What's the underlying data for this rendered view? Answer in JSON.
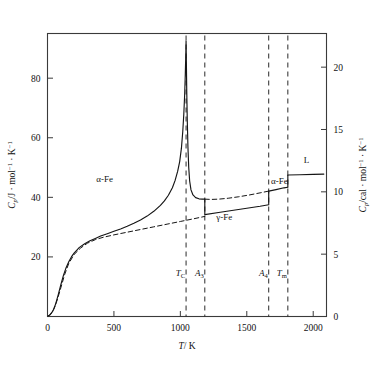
{
  "chart_data": {
    "type": "line",
    "title": "",
    "xlabel": "T/K",
    "ylabel": "Cp/J·mol-1·K-1",
    "ylabel_right": "Cp/cal·mol-1·K-1",
    "xlim": [
      0,
      2100
    ],
    "ylim": [
      0,
      95
    ],
    "ylim_right": [
      0,
      22.7
    ],
    "grid": false,
    "legend": null,
    "x_ticks": [
      0,
      500,
      1000,
      1500,
      2000
    ],
    "x_tick_labels": [
      "0",
      "500",
      "1000",
      "1500",
      "2000"
    ],
    "y_ticks": [
      20,
      40,
      60,
      80
    ],
    "y_tick_labels": [
      "20",
      "40",
      "60",
      "80"
    ],
    "y_ticks_right": [
      0,
      5,
      10,
      15,
      20
    ],
    "y_tick_labels_right": [
      "0",
      "5",
      "10",
      "15",
      "20"
    ],
    "transitions": [
      {
        "name": "T_C",
        "label_main": "T",
        "label_sub": "C",
        "x": 1043
      },
      {
        "name": "A_3",
        "label_main": "A",
        "label_sub": "3",
        "x": 1184
      },
      {
        "name": "A_4",
        "label_main": "A",
        "label_sub": "4",
        "x": 1665
      },
      {
        "name": "T_m",
        "label_main": "T",
        "label_sub": "m",
        "x": 1809
      }
    ],
    "region_labels": [
      {
        "name": "alpha-Fe-low",
        "text": "α-Fe",
        "x": 430,
        "y": 46
      },
      {
        "name": "gamma-Fe",
        "text": "γ-Fe",
        "x": 1330,
        "y": 33.5
      },
      {
        "name": "alpha-Fe-high",
        "text": "α-Fe",
        "x": 1745,
        "y": 45.5
      },
      {
        "name": "liquid",
        "text": "L",
        "x": 1950,
        "y": 52.5
      }
    ],
    "series": [
      {
        "name": "Cp-measured",
        "style": "solid",
        "points": [
          [
            5,
            0.2
          ],
          [
            20,
            0.6
          ],
          [
            40,
            1.8
          ],
          [
            60,
            4.0
          ],
          [
            80,
            7.2
          ],
          [
            100,
            10.6
          ],
          [
            120,
            13.8
          ],
          [
            140,
            16.4
          ],
          [
            160,
            18.4
          ],
          [
            180,
            20.0
          ],
          [
            200,
            21.3
          ],
          [
            240,
            23.2
          ],
          [
            280,
            24.4
          ],
          [
            320,
            25.4
          ],
          [
            360,
            26.2
          ],
          [
            400,
            27.0
          ],
          [
            450,
            27.8
          ],
          [
            500,
            28.6
          ],
          [
            550,
            29.4
          ],
          [
            600,
            30.3
          ],
          [
            650,
            31.3
          ],
          [
            700,
            32.4
          ],
          [
            750,
            33.7
          ],
          [
            800,
            35.3
          ],
          [
            850,
            37.3
          ],
          [
            880,
            38.8
          ],
          [
            910,
            40.7
          ],
          [
            940,
            43.2
          ],
          [
            960,
            45.6
          ],
          [
            980,
            48.8
          ],
          [
            995,
            52.0
          ],
          [
            1008,
            56.5
          ],
          [
            1018,
            62.0
          ],
          [
            1026,
            68.0
          ],
          [
            1032,
            74.0
          ],
          [
            1037,
            81.0
          ],
          [
            1041,
            88.0
          ],
          [
            1043,
            92.5
          ],
          [
            1045,
            86.0
          ],
          [
            1048,
            76.0
          ],
          [
            1052,
            66.0
          ],
          [
            1057,
            57.0
          ],
          [
            1063,
            50.0
          ],
          [
            1070,
            45.5
          ],
          [
            1080,
            42.5
          ],
          [
            1095,
            40.8
          ],
          [
            1115,
            39.9
          ],
          [
            1140,
            39.5
          ],
          [
            1165,
            39.4
          ],
          [
            1184,
            39.4
          ]
        ]
      },
      {
        "name": "Cp-gamma-austenite",
        "style": "solid",
        "points": [
          [
            1184,
            34.2
          ],
          [
            1300,
            35.0
          ],
          [
            1450,
            36.0
          ],
          [
            1600,
            37.0
          ],
          [
            1665,
            37.5
          ]
        ]
      },
      {
        "name": "Cp-delta-ferrite",
        "style": "solid",
        "points": [
          [
            1665,
            42.1
          ],
          [
            1720,
            42.6
          ],
          [
            1780,
            43.2
          ],
          [
            1809,
            43.4
          ]
        ]
      },
      {
        "name": "Cp-liquid",
        "style": "solid",
        "points": [
          [
            1809,
            47.5
          ],
          [
            1900,
            47.6
          ],
          [
            2000,
            47.7
          ],
          [
            2080,
            47.8
          ]
        ]
      },
      {
        "name": "Cp-lattice-baseline",
        "style": "dashed",
        "points": [
          [
            5,
            0.2
          ],
          [
            25,
            0.8
          ],
          [
            50,
            2.6
          ],
          [
            75,
            5.8
          ],
          [
            100,
            9.6
          ],
          [
            130,
            14.2
          ],
          [
            160,
            17.8
          ],
          [
            200,
            20.8
          ],
          [
            250,
            23.0
          ],
          [
            300,
            24.6
          ],
          [
            360,
            25.8
          ],
          [
            420,
            26.6
          ],
          [
            500,
            27.4
          ],
          [
            600,
            28.3
          ],
          [
            700,
            29.2
          ],
          [
            800,
            30.1
          ],
          [
            900,
            31.0
          ],
          [
            1000,
            31.9
          ],
          [
            1100,
            32.8
          ],
          [
            1184,
            33.6
          ]
        ]
      },
      {
        "name": "Cp-alpha-extrapolated-dashed",
        "style": "dashed",
        "points": [
          [
            1184,
            39.4
          ],
          [
            1230,
            39.3
          ],
          [
            1290,
            39.4
          ],
          [
            1360,
            39.7
          ],
          [
            1440,
            40.2
          ],
          [
            1520,
            40.8
          ],
          [
            1600,
            41.5
          ],
          [
            1665,
            42.1
          ]
        ]
      }
    ]
  },
  "axes": {
    "ylabel_parts": {
      "c": "C",
      "p": "p",
      "slash": "/J",
      "mid": " · mol",
      "exp1": "−1",
      "mid2": " · K",
      "exp2": "−1"
    },
    "ylabel_right_parts": {
      "c": "C",
      "p": "p",
      "slash": "/cal",
      "mid": " · mol",
      "exp1": "−1",
      "mid2": " · K",
      "exp2": "−1"
    },
    "xlabel_parts": {
      "t": "T",
      "slash": "/ K"
    }
  }
}
